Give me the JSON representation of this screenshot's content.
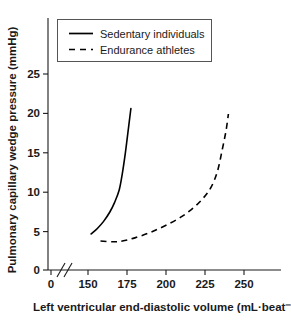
{
  "chart_data": {
    "type": "line",
    "title": "",
    "xlabel": "Left ventricular end-diastolic volume (mL·beat⁻¹)",
    "ylabel": "Pulmonary capillary wedge pressure (mmHg)",
    "xlim": [
      145,
      262
    ],
    "ylim": [
      0,
      28
    ],
    "grid": false,
    "axis_break": {
      "present": true,
      "symbol": "//",
      "between": [
        0,
        150
      ],
      "origin_tick_label": "0"
    },
    "xticks": [
      150,
      175,
      200,
      225,
      250
    ],
    "xtick_labels": [
      "150",
      "175",
      "200",
      "225",
      "250"
    ],
    "yticks": [
      0,
      5,
      10,
      15,
      20,
      25
    ],
    "ytick_labels": [
      "0",
      "5",
      "10",
      "15",
      "20",
      "25"
    ],
    "legend": {
      "position": "upper-left-inside",
      "entries": [
        {
          "name": "Sedentary individuals",
          "style": "solid",
          "color": "#000000"
        },
        {
          "name": "Endurance athletes",
          "style": "dashed",
          "color": "#000000"
        }
      ]
    },
    "series": [
      {
        "name": "Sedentary individuals",
        "style": "solid",
        "color": "#000000",
        "x": [
          152,
          156,
          160,
          164,
          167,
          170,
          172,
          174,
          176,
          177.5
        ],
        "y": [
          4.6,
          5.3,
          6.2,
          7.4,
          8.6,
          10.2,
          12.3,
          15.0,
          18.2,
          20.6
        ]
      },
      {
        "name": "Endurance athletes",
        "style": "dashed",
        "color": "#000000",
        "x": [
          158,
          166,
          172,
          180,
          190,
          200,
          210,
          218,
          224,
          229,
          233,
          236,
          238.5,
          240
        ],
        "y": [
          3.7,
          3.6,
          3.7,
          4.1,
          4.8,
          5.7,
          6.8,
          8.0,
          9.2,
          10.6,
          12.6,
          15.3,
          17.8,
          19.9
        ]
      }
    ],
    "axis_colors": {
      "axis": "#1a1a1a",
      "text": "#1a1a1a",
      "background": "#ffffff"
    }
  }
}
